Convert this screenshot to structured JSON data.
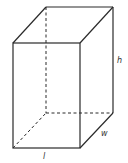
{
  "diagram": {
    "type": "rectangular-prism",
    "labels": {
      "length": "l",
      "width": "w",
      "height": "h"
    },
    "colors": {
      "line": "#2a2a2a",
      "label": "#333333",
      "background": "#ffffff"
    }
  }
}
